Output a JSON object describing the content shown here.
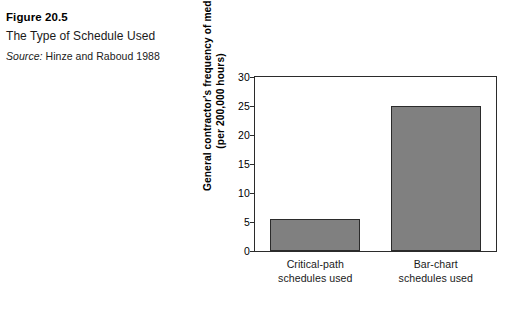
{
  "caption": {
    "figure_number": "Figure 20.5",
    "title": "The Type of Schedule Used",
    "source_word": "Source:",
    "source_text": "Hinze and Raboud 1988"
  },
  "chart_data": {
    "type": "bar",
    "title": "The Type of Schedule Used",
    "categories": [
      "Critical-path schedules used",
      "Bar-chart schedules used"
    ],
    "category_lines": [
      [
        "Critical-path",
        "schedules used"
      ],
      [
        "Bar-chart",
        "schedules used"
      ]
    ],
    "values": [
      5.6,
      25
    ],
    "xlabel": "",
    "ylabel": "General contractor's frequency of medical-case injuries (per 200,000 hours)",
    "ylabel_lines": [
      "General contractor's frequency of medical-case injuries",
      "(per 200,000 hours)"
    ],
    "ylim": [
      0,
      30
    ],
    "yticks": [
      0,
      5,
      10,
      15,
      20,
      25,
      30
    ],
    "ytick_labels": [
      "0",
      "5",
      "10",
      "15",
      "20",
      "25",
      "30"
    ],
    "grid": false,
    "legend": "none",
    "bar_fill_color": "#808080",
    "bar_edge_color": "#2b2b2b",
    "frame_color": "#2b2b2b",
    "background_color": "#ffffff"
  }
}
